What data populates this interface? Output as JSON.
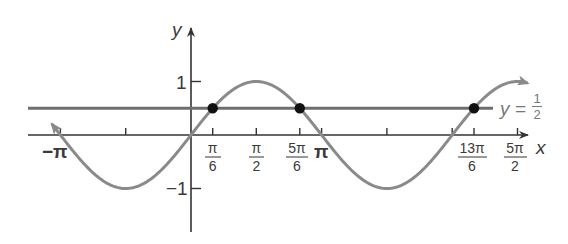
{
  "chart_data": {
    "type": "line",
    "title": "",
    "xlabel": "x",
    "ylabel": "y",
    "xlim": [
      -3.6,
      8.2
    ],
    "ylim": [
      -1.9,
      1.7
    ],
    "grid": false,
    "series": [
      {
        "name": "y = sin x",
        "function": "sin(x)",
        "color": "#8a8a8a",
        "x_range": [
          -3.35,
          8.1
        ],
        "arrows": "both"
      },
      {
        "name": "y = 1/2",
        "function": "0.5",
        "color": "#6e6e6e",
        "x_range": [
          -3.45,
          7.5
        ]
      }
    ],
    "intersection_points": [
      {
        "x_label": "π/6",
        "x": 0.5236,
        "y": 0.5
      },
      {
        "x_label": "5π/6",
        "x": 2.618,
        "y": 0.5
      },
      {
        "x_label": "13π/6",
        "x": 6.8068,
        "y": 0.5
      }
    ],
    "x_ticks": [
      {
        "value": -3.1416,
        "label": "−π"
      },
      {
        "value": -1.5708,
        "label": ""
      },
      {
        "value": 0.5236,
        "label_num": "π",
        "label_den": "6"
      },
      {
        "value": 1.5708,
        "label_num": "π",
        "label_den": "2"
      },
      {
        "value": 2.618,
        "label_num": "5π",
        "label_den": "6"
      },
      {
        "value": 3.1416,
        "label": "π"
      },
      {
        "value": 4.7124,
        "label": ""
      },
      {
        "value": 6.2832,
        "label": ""
      },
      {
        "value": 6.8068,
        "label_num": "13π",
        "label_den": "6"
      },
      {
        "value": 7.854,
        "label_num": "5π",
        "label_den": "2"
      }
    ],
    "y_ticks": [
      {
        "value": 1,
        "label": "1"
      },
      {
        "value": -1,
        "label": "−1"
      }
    ],
    "annotations": [
      {
        "text_prefix": "y = ",
        "num": "1",
        "den": "2",
        "near": "right end of horizontal line"
      }
    ]
  },
  "labels": {
    "x_axis": "x",
    "y_axis": "y",
    "y_one": "1",
    "y_neg_one": "−1",
    "neg_pi": "−π",
    "pi": "π",
    "pi6_num": "π",
    "pi6_den": "6",
    "pi2_num": "π",
    "pi2_den": "2",
    "fivepi6_num": "5π",
    "fivepi6_den": "6",
    "thirteenpi6_num": "13π",
    "thirteenpi6_den": "6",
    "fivepi2_num": "5π",
    "fivepi2_den": "2",
    "line_label_prefix": "y =",
    "line_label_num": "1",
    "line_label_den": "2"
  }
}
